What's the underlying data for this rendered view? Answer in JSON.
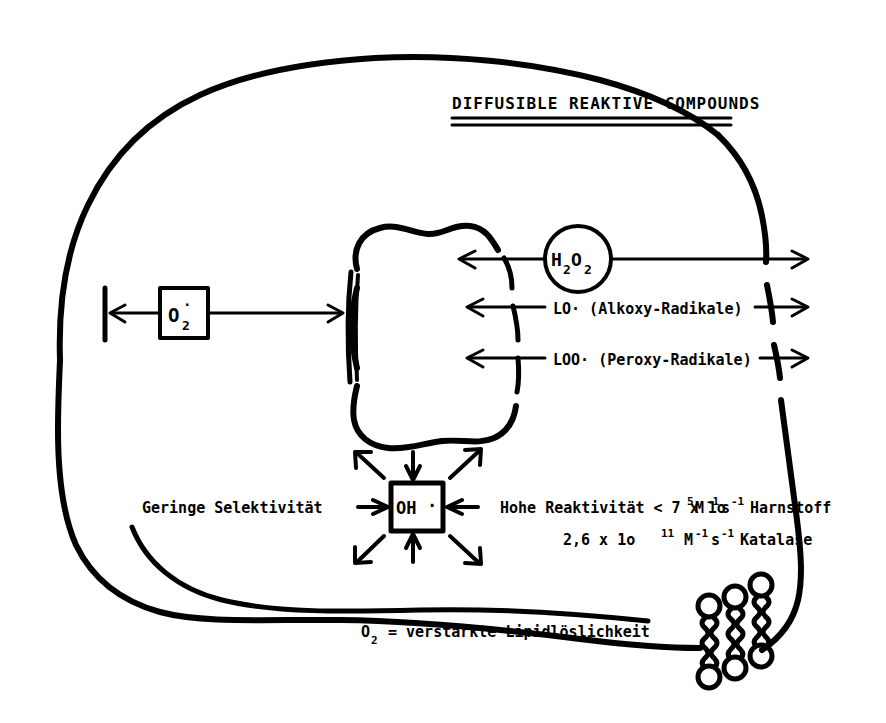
{
  "figure": {
    "title": "DIFFUSIBLE  REAKTIVE COMPOUNDS",
    "background_color": "#ffffff",
    "ink_color": "#000000"
  },
  "species": {
    "superoxide_label": "O",
    "superoxide_sub": "2",
    "superoxide_radical_dot": "·",
    "peroxide_label": "H",
    "peroxide_sub1": "2",
    "peroxide_mid": "O",
    "peroxide_sub2": "2",
    "hydroxyl_label": "OH",
    "hydroxyl_dot": "·"
  },
  "transport_rows": [
    {
      "name": "hydrogen-peroxide",
      "label": "H2O2",
      "in_circle": true
    },
    {
      "name": "alkoxy-radical",
      "label": "LO· (Alkoxy-Radikale)"
    },
    {
      "name": "peroxy-radical",
      "label": "LOO· (Peroxy-Radikale)"
    }
  ],
  "annotations": {
    "selectivity": "Geringe Selektivität",
    "reactivity_line1_prefix": "Hohe Reaktivität < 7 x 1o",
    "reactivity_line1_exp": "5",
    "reactivity_line1_unit_m": "M",
    "reactivity_line1_unit_m_exp": "-1",
    "reactivity_line1_unit_s": "s",
    "reactivity_line1_unit_s_exp": "-1",
    "reactivity_line1_suffix": "Harnstoff",
    "reactivity_line2_prefix": "2,6 x 1o",
    "reactivity_line2_exp": "11",
    "reactivity_line2_unit_m": "M",
    "reactivity_line2_unit_m_exp": "-1",
    "reactivity_line2_unit_s": "s",
    "reactivity_line2_unit_s_exp": "-1",
    "reactivity_line2_suffix": "Katalase",
    "lipid_solubility_prefix": "O",
    "lipid_solubility_sub": "2",
    "lipid_solubility_text": "= verstärkte Lipidlöslichkeit"
  },
  "structures": {
    "cell_membrane": "cell-outline",
    "nucleus": "nucleus-outline",
    "phospholipid_count": 3
  }
}
